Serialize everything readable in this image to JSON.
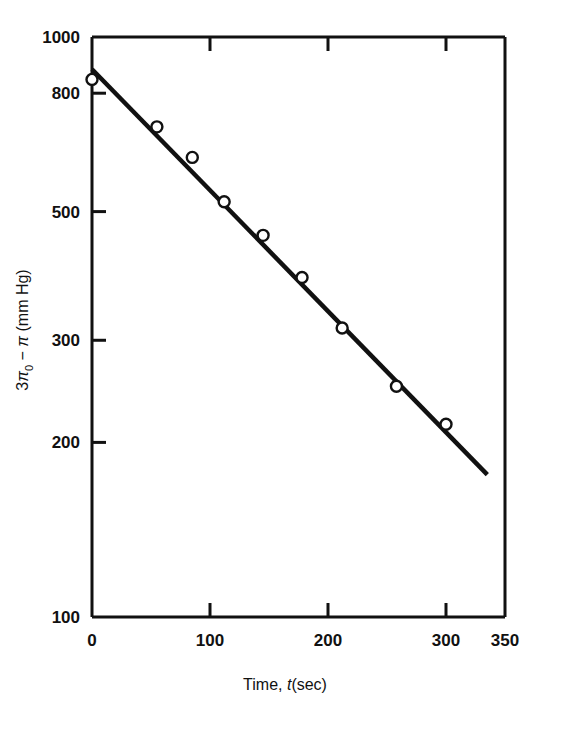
{
  "figure": {
    "name": "semilog-decay-plot",
    "background": "#ffffff",
    "ink": "#111111"
  },
  "chart_data": {
    "type": "scatter",
    "title": "",
    "subtitle": "",
    "xlabel_parts": {
      "prefix": "Time, ",
      "italic": "t",
      "suffix": "(sec)"
    },
    "xlabel": "Time, t(sec)",
    "ylabel_parts": {
      "lead": "3",
      "pi": "π",
      "sub": "0",
      "minus": " − ",
      "pi2": "π",
      "units": " (mm Hg)"
    },
    "ylabel": "3π0 − π (mm Hg)",
    "xscale": "linear",
    "yscale": "log",
    "xlim": [
      0,
      350
    ],
    "ylim": [
      100,
      1000
    ],
    "grid": false,
    "legend": null,
    "x_ticks": [
      {
        "value": 0,
        "label": "0"
      },
      {
        "value": 100,
        "label": "100"
      },
      {
        "value": 200,
        "label": "200"
      },
      {
        "value": 300,
        "label": "300"
      },
      {
        "value": 350,
        "label": "350"
      }
    ],
    "y_ticks": [
      {
        "value": 1000,
        "label": "1000"
      },
      {
        "value": 800,
        "label": "800"
      },
      {
        "value": 500,
        "label": "500"
      },
      {
        "value": 300,
        "label": "300"
      },
      {
        "value": 200,
        "label": "200"
      },
      {
        "value": 100,
        "label": "100"
      }
    ],
    "marker": "open-circle",
    "points": [
      {
        "x": 0,
        "y": 845
      },
      {
        "x": 55,
        "y": 700
      },
      {
        "x": 85,
        "y": 620
      },
      {
        "x": 112,
        "y": 520
      },
      {
        "x": 145,
        "y": 455
      },
      {
        "x": 178,
        "y": 385
      },
      {
        "x": 212,
        "y": 315
      },
      {
        "x": 258,
        "y": 250
      },
      {
        "x": 300,
        "y": 215
      }
    ],
    "fit_line": {
      "name": "best-fit-line",
      "x_start": 0,
      "y_start": 880,
      "x_end": 335,
      "y_end": 176
    }
  }
}
